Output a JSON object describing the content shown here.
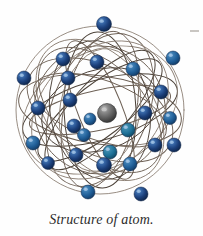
{
  "figure": {
    "caption": "Structure of atom.",
    "alt_label": "atom-diagram",
    "background_color": "#fefefe"
  },
  "colors": {
    "orbit_line_dark": "#4c4239",
    "orbit_line_mid": "#6e6156",
    "orbit_line_light": "#8d8176",
    "electron_dark": "#1b3f7a",
    "electron_mid": "#1f5d96",
    "electron_teal": "#1d6f96",
    "electron_highlight": "#9fc2e4",
    "electron_edge": "#0e2447",
    "nucleus_body": "#595959",
    "nucleus_highlight": "#c9c9c9",
    "nucleus_edge": "#2e2e2e",
    "caption_text": "#2b2b2b",
    "corner_mark": "#c9c6c2"
  },
  "nucleus": {
    "label": "nucleus",
    "cx": 107,
    "cy": 113,
    "r": 9.5
  },
  "orbits": [
    {
      "cx": 100,
      "cy": 110,
      "rx": 84,
      "ry": 84,
      "rot": 0,
      "w": 0.9,
      "shade": "light"
    },
    {
      "cx": 100,
      "cy": 110,
      "rx": 82,
      "ry": 34,
      "rot": 8,
      "w": 1.0,
      "shade": "mid"
    },
    {
      "cx": 100,
      "cy": 110,
      "rx": 80,
      "ry": 30,
      "rot": -16,
      "w": 1.0,
      "shade": "dark"
    },
    {
      "cx": 100,
      "cy": 110,
      "rx": 78,
      "ry": 44,
      "rot": 26,
      "w": 0.9,
      "shade": "mid"
    },
    {
      "cx": 100,
      "cy": 110,
      "rx": 76,
      "ry": 26,
      "rot": -38,
      "w": 1.0,
      "shade": "dark"
    },
    {
      "cx": 100,
      "cy": 110,
      "rx": 80,
      "ry": 52,
      "rot": 52,
      "w": 0.9,
      "shade": "light"
    },
    {
      "cx": 100,
      "cy": 110,
      "rx": 74,
      "ry": 22,
      "rot": 68,
      "w": 1.0,
      "shade": "mid"
    },
    {
      "cx": 100,
      "cy": 110,
      "rx": 78,
      "ry": 36,
      "rot": 88,
      "w": 1.0,
      "shade": "dark"
    },
    {
      "cx": 100,
      "cy": 110,
      "rx": 80,
      "ry": 48,
      "rot": 112,
      "w": 0.9,
      "shade": "mid"
    },
    {
      "cx": 100,
      "cy": 110,
      "rx": 76,
      "ry": 28,
      "rot": 132,
      "w": 1.0,
      "shade": "dark"
    },
    {
      "cx": 100,
      "cy": 110,
      "rx": 82,
      "ry": 58,
      "rot": 152,
      "w": 0.9,
      "shade": "light"
    },
    {
      "cx": 100,
      "cy": 110,
      "rx": 72,
      "ry": 20,
      "rot": 168,
      "w": 1.0,
      "shade": "mid"
    },
    {
      "cx": 100,
      "cy": 110,
      "rx": 66,
      "ry": 64,
      "rot": 20,
      "w": 0.9,
      "shade": "mid"
    },
    {
      "cx": 100,
      "cy": 110,
      "rx": 50,
      "ry": 70,
      "rot": -10,
      "w": 0.9,
      "shade": "dark"
    },
    {
      "cx": 100,
      "cy": 110,
      "rx": 36,
      "ry": 80,
      "rot": 12,
      "w": 0.9,
      "shade": "mid"
    },
    {
      "cx": 100,
      "cy": 110,
      "rx": 58,
      "ry": 78,
      "rot": 44,
      "w": 0.9,
      "shade": "light"
    },
    {
      "cx": 100,
      "cy": 110,
      "rx": 44,
      "ry": 76,
      "rot": -44,
      "w": 0.9,
      "shade": "mid"
    },
    {
      "cx": 100,
      "cy": 110,
      "rx": 62,
      "ry": 40,
      "rot": 100,
      "w": 0.9,
      "shade": "light"
    },
    {
      "cx": 100,
      "cy": 110,
      "rx": 40,
      "ry": 60,
      "rot": 72,
      "w": 0.9,
      "shade": "dark"
    },
    {
      "cx": 100,
      "cy": 110,
      "rx": 30,
      "ry": 70,
      "rot": -70,
      "w": 0.9,
      "shade": "mid"
    }
  ],
  "electrons": [
    {
      "cx": 104,
      "cy": 24,
      "r": 7.5,
      "tone": "dark"
    },
    {
      "cx": 63,
      "cy": 59,
      "r": 7.0,
      "tone": "dark"
    },
    {
      "cx": 97,
      "cy": 62,
      "r": 7.0,
      "tone": "dark"
    },
    {
      "cx": 133,
      "cy": 69,
      "r": 7.0,
      "tone": "mid"
    },
    {
      "cx": 173,
      "cy": 58,
      "r": 7.0,
      "tone": "mid"
    },
    {
      "cx": 24,
      "cy": 78,
      "r": 7.0,
      "tone": "dark"
    },
    {
      "cx": 68,
      "cy": 78,
      "r": 7.0,
      "tone": "dark"
    },
    {
      "cx": 161,
      "cy": 92,
      "r": 7.0,
      "tone": "dark"
    },
    {
      "cx": 38,
      "cy": 108,
      "r": 7.0,
      "tone": "dark"
    },
    {
      "cx": 70,
      "cy": 100,
      "r": 7.0,
      "tone": "dark"
    },
    {
      "cx": 145,
      "cy": 113,
      "r": 7.0,
      "tone": "dark"
    },
    {
      "cx": 170,
      "cy": 118,
      "r": 6.5,
      "tone": "mid"
    },
    {
      "cx": 90,
      "cy": 119,
      "r": 6.0,
      "tone": "mid"
    },
    {
      "cx": 74,
      "cy": 126,
      "r": 7.0,
      "tone": "dark"
    },
    {
      "cx": 128,
      "cy": 130,
      "r": 7.0,
      "tone": "teal"
    },
    {
      "cx": 84,
      "cy": 135,
      "r": 6.5,
      "tone": "mid"
    },
    {
      "cx": 33,
      "cy": 143,
      "r": 7.0,
      "tone": "mid"
    },
    {
      "cx": 155,
      "cy": 145,
      "r": 7.0,
      "tone": "dark"
    },
    {
      "cx": 174,
      "cy": 145,
      "r": 7.0,
      "tone": "dark"
    },
    {
      "cx": 76,
      "cy": 155,
      "r": 7.0,
      "tone": "dark"
    },
    {
      "cx": 110,
      "cy": 152,
      "r": 7.0,
      "tone": "teal"
    },
    {
      "cx": 48,
      "cy": 163,
      "r": 6.5,
      "tone": "dark"
    },
    {
      "cx": 104,
      "cy": 165,
      "r": 7.5,
      "tone": "dark"
    },
    {
      "cx": 130,
      "cy": 164,
      "r": 7.0,
      "tone": "mid"
    },
    {
      "cx": 88,
      "cy": 192,
      "r": 7.0,
      "tone": "mid"
    },
    {
      "cx": 141,
      "cy": 194,
      "r": 7.0,
      "tone": "dark"
    }
  ]
}
